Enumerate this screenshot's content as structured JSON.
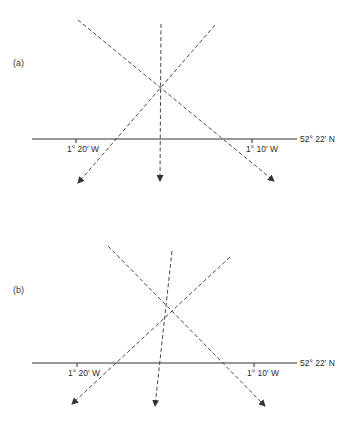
{
  "panels": [
    {
      "label": "(a)",
      "latitude_label": "52° 22′ N",
      "tick_labels": [
        "1° 20′ W",
        "1° 10′ W"
      ],
      "description": "Three bearing lines intersect at a single point above the latitude line"
    },
    {
      "label": "(b)",
      "latitude_label": "52° 22′ N",
      "tick_labels": [
        "1° 20′ W",
        "1° 10′ W"
      ],
      "description": "Three bearing lines form a small triangle (cocked hat) above the latitude line"
    }
  ]
}
